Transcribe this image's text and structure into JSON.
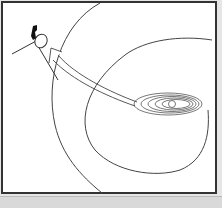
{
  "diagram": {
    "elements": {
      "spacecraft": "probe-icon",
      "trajectory": "arrow",
      "inner_boundary": "termination-shock",
      "outer_boundary": "heliopause",
      "center": "solar-system-orbits"
    },
    "colors": {
      "line": "#444444",
      "background": "#ffffff",
      "frame": "#333333",
      "bottom_band": "#d9d9d9"
    }
  }
}
